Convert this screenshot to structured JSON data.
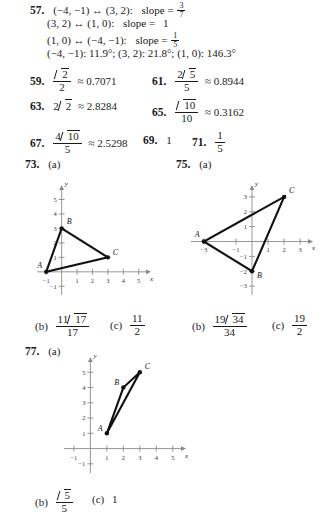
{
  "problem57": {
    "number": "57.",
    "lines": [
      {
        "pair": "(−4, −1) ↔ (3, 2):",
        "label": "slope =",
        "value_type": "fraction",
        "num": "3",
        "den": "7"
      },
      {
        "pair": "(3, 2) ↔ (1, 0):",
        "label": "slope =",
        "value_type": "int",
        "value": "1"
      },
      {
        "pair": "(1, 0) ↔ (−4, −1):",
        "label": "slope =",
        "value_type": "fraction",
        "num": "1",
        "den": "5"
      }
    ],
    "angles": "(−4, −1):  11.9°; (3, 2):  21.8°; (1, 0):  146.3°"
  },
  "problem59": {
    "number": "59.",
    "radicand": "2",
    "den": "2",
    "approx": "≈ 0.7071"
  },
  "problem61": {
    "number": "61.",
    "coef": "2",
    "radicand": "5",
    "den": "5",
    "approx": "≈ 0.8944"
  },
  "problem63": {
    "number": "63.",
    "coef": "2",
    "radicand": "2",
    "approx": "≈ 2.8284"
  },
  "problem65": {
    "number": "65.",
    "radicand": "10",
    "den": "10",
    "approx": "≈ 0.3162"
  },
  "problem67": {
    "number": "67.",
    "coef": "4",
    "radicand": "10",
    "den": "5",
    "approx": "≈ 2.5298"
  },
  "problem69": {
    "number": "69.",
    "value": "1"
  },
  "problem71": {
    "number": "71.",
    "num": "1",
    "den": "5"
  },
  "problem73": {
    "number": "73.",
    "part_a": "(a)",
    "part_b_label": "(b)",
    "part_b": {
      "coef": "11",
      "radicand": "17",
      "den": "17"
    },
    "part_c_label": "(c)",
    "part_c": {
      "num": "11",
      "den": "2"
    },
    "chart_data": {
      "type": "scatter",
      "title": "",
      "xlabel": "x",
      "ylabel": "y",
      "xlim": [
        -1.6,
        5.8
      ],
      "ylim": [
        -1.6,
        6.0
      ],
      "xticks": [
        -1,
        1,
        2,
        3,
        4,
        5
      ],
      "yticks": [
        -1,
        1,
        2,
        3,
        4,
        5
      ],
      "xticklabels": [
        "−1",
        "1",
        "2",
        "3",
        "4",
        "5"
      ],
      "yticklabels": [
        "−1",
        "1",
        "2",
        "3",
        "4",
        "5"
      ],
      "grid": false,
      "points": [
        {
          "name": "A",
          "x": -1,
          "y": 0,
          "label_dx": -9,
          "label_dy": -4
        },
        {
          "name": "B",
          "x": 0,
          "y": 3,
          "label_dx": 5,
          "label_dy": -4
        },
        {
          "name": "C",
          "x": 3,
          "y": 1,
          "label_dx": 5,
          "label_dy": -2
        }
      ],
      "polygon": [
        "A",
        "B",
        "C"
      ]
    }
  },
  "problem75": {
    "number": "75.",
    "part_a": "(a)",
    "part_b_label": "(b)",
    "part_b": {
      "coef": "19",
      "radicand": "34",
      "den": "34"
    },
    "part_c_label": "(c)",
    "part_c": {
      "num": "19",
      "den": "2"
    },
    "chart_data": {
      "type": "scatter",
      "title": "",
      "xlabel": "x",
      "ylabel": "y",
      "xlim": [
        -3.8,
        3.8
      ],
      "ylim": [
        -3.6,
        3.8
      ],
      "xticks": [
        -3,
        -1,
        1,
        2,
        3
      ],
      "yticks": [
        -3,
        -2,
        -1,
        1,
        2,
        3
      ],
      "xticklabels": [
        "−3",
        "−1",
        "1",
        "2",
        "3"
      ],
      "yticklabels": [
        "−3",
        "−2",
        "−1",
        "1",
        "2",
        "3"
      ],
      "grid": false,
      "points": [
        {
          "name": "A",
          "x": -3,
          "y": 0,
          "label_dx": -9,
          "label_dy": -4
        },
        {
          "name": "B",
          "x": 0,
          "y": -2,
          "label_dx": 5,
          "label_dy": 7
        },
        {
          "name": "C",
          "x": 2,
          "y": 3,
          "label_dx": 5,
          "label_dy": -4
        }
      ],
      "polygon": [
        "A",
        "B",
        "C"
      ]
    }
  },
  "problem77": {
    "number": "77.",
    "part_a": "(a)",
    "part_b_label": "(b)",
    "part_b": {
      "radicand": "5",
      "den": "5"
    },
    "part_c_label": "(c)",
    "part_c": {
      "value": "1"
    },
    "chart_data": {
      "type": "scatter",
      "title": "",
      "xlabel": "x",
      "ylabel": "y",
      "xlim": [
        -1.6,
        5.8
      ],
      "ylim": [
        -1.6,
        6.0
      ],
      "xticks": [
        -1,
        1,
        2,
        3,
        4,
        5
      ],
      "yticks": [
        -1,
        1,
        2,
        3,
        4,
        5
      ],
      "xticklabels": [
        "−1",
        "1",
        "2",
        "3",
        "4",
        "5"
      ],
      "yticklabels": [
        "−1",
        "1",
        "2",
        "3",
        "4",
        "5"
      ],
      "grid": false,
      "points": [
        {
          "name": "A",
          "x": 1,
          "y": 1,
          "label_dx": -9,
          "label_dy": -2
        },
        {
          "name": "B",
          "x": 2,
          "y": 4,
          "label_dx": -9,
          "label_dy": -3
        },
        {
          "name": "C",
          "x": 3,
          "y": 5,
          "label_dx": 5,
          "label_dy": -3
        }
      ],
      "polygon": [
        "A",
        "B",
        "C"
      ]
    }
  }
}
